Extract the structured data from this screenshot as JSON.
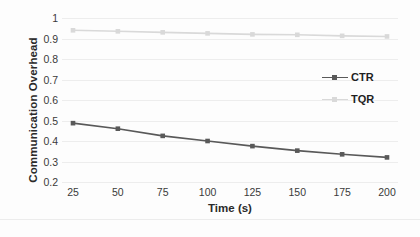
{
  "chart_data": {
    "type": "line",
    "title": "",
    "xlabel": "Time (s)",
    "ylabel": "Communication Overhead",
    "x": [
      25,
      50,
      75,
      100,
      125,
      150,
      175,
      200
    ],
    "categories": [
      "25",
      "50",
      "75",
      "100",
      "125",
      "150",
      "175",
      "200"
    ],
    "series": [
      {
        "name": "CTR",
        "color": "#595959",
        "marker": "square",
        "values": [
          0.487,
          0.46,
          0.425,
          0.4,
          0.375,
          0.353,
          0.335,
          0.32
        ]
      },
      {
        "name": "TQR",
        "color": "#d9d9d9",
        "marker": "square",
        "values": [
          0.94,
          0.935,
          0.93,
          0.925,
          0.92,
          0.918,
          0.913,
          0.91
        ]
      }
    ],
    "ylim": [
      0.2,
      1.0
    ],
    "ytick_labels": [
      "1",
      "0.9",
      "0.8",
      "0.7",
      "0.6",
      "0.5",
      "0.4",
      "0.3",
      "0.2"
    ],
    "ytick_values": [
      1,
      0.9,
      0.8,
      0.7,
      0.6,
      0.5,
      0.4,
      0.3,
      0.2
    ],
    "grid": true,
    "grid_color": "#ededed",
    "legend_position": "right",
    "legend_entries": [
      "CTR",
      "TQR"
    ],
    "background": "#ffffff"
  }
}
